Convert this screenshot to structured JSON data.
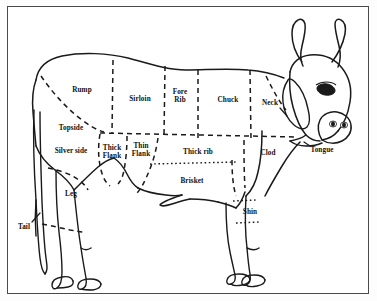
{
  "document": {
    "title": "Beef Cuts Butcher Diagram",
    "subject": "cow-side-view",
    "border_color": "#4a4a4a",
    "line_color": "#1a1a1a",
    "background_color": "#ffffff",
    "width": 377,
    "height": 301
  },
  "diagram": {
    "type": "butchery-cut-chart",
    "animal": "cow",
    "orientation": "right-facing side profile",
    "line_styles": {
      "outline": "solid",
      "primary_cut_divider": "dashed",
      "secondary_cut_divider": "dotted"
    },
    "cuts": [
      {
        "id": "rump",
        "label": "Rump",
        "lines": [
          "Rump"
        ],
        "x": 82,
        "y": 90,
        "region": "hindquarter-top"
      },
      {
        "id": "sirloin",
        "label": "Sirloin",
        "lines": [
          "Sirloin"
        ],
        "x": 140,
        "y": 99,
        "region": "back-mid"
      },
      {
        "id": "fore-rib",
        "label": "Fore Rib",
        "lines": [
          "Fore",
          "Rib"
        ],
        "x": 180,
        "y": 96,
        "region": "back-front"
      },
      {
        "id": "chuck",
        "label": "Chuck",
        "lines": [
          "Chuck"
        ],
        "x": 228,
        "y": 100,
        "region": "shoulder-top"
      },
      {
        "id": "neck",
        "label": "Neck",
        "lines": [
          "Neck"
        ],
        "x": 270,
        "y": 103,
        "region": "neck"
      },
      {
        "id": "topside",
        "label": "Topside",
        "lines": [
          "Topside"
        ],
        "x": 71,
        "y": 128,
        "region": "hindquarter-mid"
      },
      {
        "id": "silver-side",
        "label": "Silver side",
        "lines": [
          "Silver side"
        ],
        "x": 71,
        "y": 151,
        "region": "hindquarter-rear"
      },
      {
        "id": "thick-flank",
        "label": "Thick Flank",
        "lines": [
          "Thick",
          "Flank"
        ],
        "x": 112,
        "y": 152,
        "region": "flank-upper"
      },
      {
        "id": "thin-flank",
        "label": "Thin Flank",
        "lines": [
          "Thin",
          "Flank"
        ],
        "x": 141,
        "y": 150,
        "region": "flank-lower"
      },
      {
        "id": "thick-rib",
        "label": "Thick rib",
        "lines": [
          "Thick rib"
        ],
        "x": 198,
        "y": 152,
        "region": "side-mid"
      },
      {
        "id": "clod",
        "label": "Clod",
        "lines": [
          "Clod"
        ],
        "x": 268,
        "y": 153,
        "region": "shoulder-lower"
      },
      {
        "id": "tongue",
        "label": "Tongue",
        "lines": [
          "Tongue"
        ],
        "x": 322,
        "y": 150,
        "region": "head"
      },
      {
        "id": "brisket",
        "label": "Brisket",
        "lines": [
          "Brisket"
        ],
        "x": 192,
        "y": 181,
        "region": "chest-lower"
      },
      {
        "id": "leg",
        "label": "Leg",
        "lines": [
          "Leg"
        ],
        "x": 71,
        "y": 194,
        "region": "hind-leg"
      },
      {
        "id": "shin",
        "label": "Shin",
        "lines": [
          "Shin"
        ],
        "x": 250,
        "y": 212,
        "region": "fore-leg"
      },
      {
        "id": "tail",
        "label": "Tail",
        "lines": [
          "Tail"
        ],
        "x": 24,
        "y": 227,
        "region": "tail"
      }
    ]
  }
}
